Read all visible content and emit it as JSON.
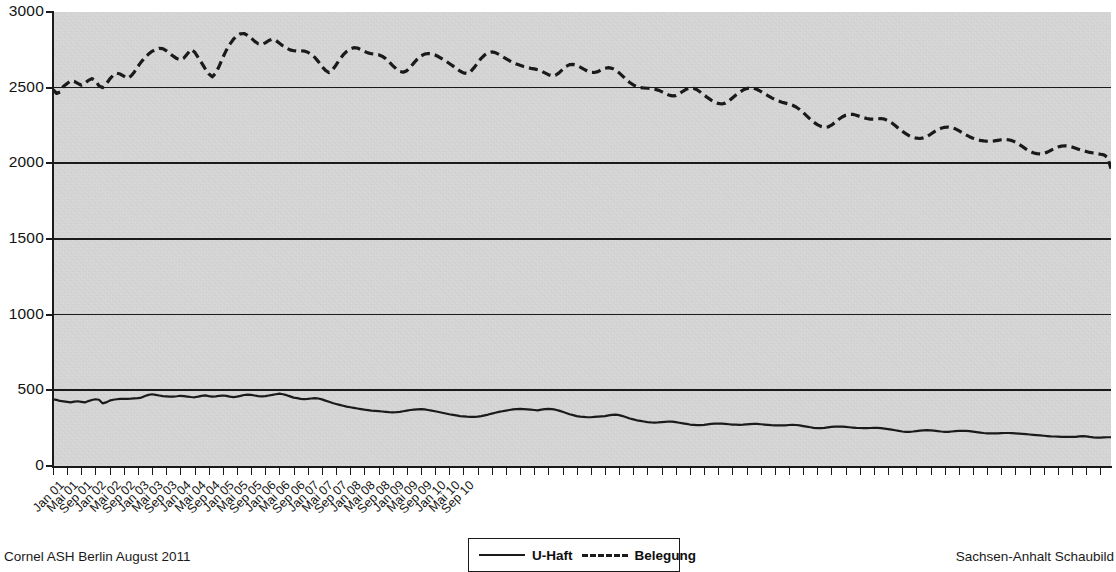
{
  "chart_data": {
    "type": "line",
    "title": "",
    "subtitle": "",
    "xlabel": "",
    "ylabel": "",
    "ylim": [
      0,
      3000
    ],
    "ytick_step": 500,
    "ytick_labels": [
      "3000",
      "2500",
      "2000",
      "1500",
      "1000",
      "500",
      "0"
    ],
    "ytick_values": [
      3000,
      2500,
      2000,
      1500,
      1000,
      500,
      0
    ],
    "grid": "horizontal",
    "legend_position": "bottom-center",
    "plot_background": "#d7d7d7",
    "line_color": "#1a1a1a",
    "x_start": "Jan 01",
    "x_end": "Dez 10",
    "x_tick_interval_months": 4,
    "xtick_labels": [
      "Jan 01",
      "Mai 01",
      "Sep 01",
      "Jan 02",
      "Mai 02",
      "Sep 02",
      "Jan 03",
      "Mai 03",
      "Sep 03",
      "Jan 04",
      "Mai 04",
      "Sep 04",
      "Jan 05",
      "Mai 05",
      "Sep 05",
      "Jan 06",
      "Mai 06",
      "Sep 06",
      "Jan 07",
      "Mai 07",
      "Sep 07",
      "Jan 08",
      "Mai 08",
      "Sep 08",
      "Jan 09",
      "Mai 09",
      "Sep 09",
      "Jan 10",
      "Mai 10",
      "Sep 10"
    ],
    "series": [
      {
        "name": "U-Haft",
        "style": "solid",
        "values": [
          441,
          437,
          430,
          427,
          424,
          420,
          425,
          428,
          424,
          420,
          429,
          436,
          441,
          438,
          414,
          420,
          432,
          438,
          441,
          443,
          444,
          444,
          445,
          447,
          449,
          452,
          462,
          470,
          474,
          470,
          466,
          462,
          460,
          458,
          459,
          461,
          464,
          462,
          459,
          456,
          454,
          458,
          463,
          467,
          462,
          458,
          460,
          464,
          466,
          463,
          458,
          455,
          458,
          463,
          469,
          472,
          470,
          466,
          462,
          460,
          462,
          466,
          470,
          474,
          478,
          474,
          468,
          460,
          452,
          448,
          444,
          442,
          443,
          446,
          449,
          446,
          440,
          432,
          424,
          416,
          410,
          404,
          398,
          392,
          388,
          384,
          380,
          376,
          372,
          369,
          366,
          364,
          362,
          360,
          358,
          356,
          355,
          356,
          358,
          362,
          366,
          370,
          372,
          374,
          376,
          374,
          370,
          366,
          362,
          357,
          352,
          347,
          342,
          338,
          334,
          330,
          328,
          326,
          325,
          324,
          326,
          330,
          335,
          340,
          346,
          352,
          358,
          362,
          366,
          370,
          374,
          376,
          377,
          376,
          374,
          372,
          370,
          368,
          372,
          376,
          378,
          376,
          372,
          366,
          358,
          350,
          342,
          336,
          330,
          326,
          324,
          322,
          322,
          324,
          326,
          328,
          330,
          334,
          338,
          340,
          336,
          330,
          322,
          314,
          308,
          302,
          298,
          294,
          290,
          288,
          287,
          288,
          290,
          292,
          294,
          293,
          290,
          286,
          282,
          278,
          274,
          272,
          270,
          270,
          272,
          275,
          278,
          280,
          281,
          280,
          278,
          276,
          274,
          273,
          272,
          273,
          275,
          277,
          279,
          278,
          276,
          274,
          272,
          270,
          269,
          268,
          268,
          269,
          271,
          272,
          271,
          268,
          264,
          260,
          256,
          252,
          250,
          250,
          252,
          255,
          258,
          260,
          261,
          260,
          258,
          256,
          254,
          252,
          251,
          250,
          250,
          251,
          252,
          252,
          250,
          247,
          244,
          240,
          236,
          232,
          228,
          226,
          226,
          228,
          231,
          234,
          236,
          237,
          236,
          234,
          231,
          228,
          226,
          226,
          228,
          230,
          232,
          233,
          232,
          230,
          227,
          224,
          221,
          218,
          216,
          215,
          215,
          216,
          217,
          218,
          218,
          217,
          216,
          214,
          212,
          210,
          208,
          206,
          204,
          202,
          200,
          198,
          196,
          195,
          194,
          193,
          193,
          192,
          192,
          193,
          196,
          198,
          196,
          192,
          189,
          188,
          188,
          189,
          190,
          190
        ]
      },
      {
        "name": "Belegung",
        "style": "dashed",
        "values": [
          2487,
          2462,
          2472,
          2510,
          2528,
          2545,
          2542,
          2528,
          2516,
          2528,
          2548,
          2560,
          2546,
          2512,
          2500,
          2524,
          2556,
          2582,
          2596,
          2590,
          2576,
          2562,
          2576,
          2604,
          2640,
          2672,
          2700,
          2722,
          2740,
          2752,
          2760,
          2758,
          2744,
          2726,
          2708,
          2692,
          2684,
          2696,
          2724,
          2752,
          2736,
          2700,
          2664,
          2626,
          2592,
          2572,
          2596,
          2644,
          2700,
          2748,
          2788,
          2820,
          2844,
          2856,
          2858,
          2846,
          2828,
          2806,
          2790,
          2786,
          2796,
          2812,
          2820,
          2812,
          2794,
          2776,
          2762,
          2750,
          2744,
          2742,
          2744,
          2742,
          2734,
          2720,
          2700,
          2672,
          2640,
          2614,
          2600,
          2618,
          2650,
          2686,
          2716,
          2740,
          2756,
          2764,
          2762,
          2752,
          2740,
          2730,
          2724,
          2722,
          2718,
          2708,
          2692,
          2670,
          2646,
          2624,
          2608,
          2602,
          2612,
          2636,
          2664,
          2690,
          2710,
          2722,
          2726,
          2724,
          2716,
          2704,
          2690,
          2676,
          2660,
          2644,
          2626,
          2610,
          2598,
          2594,
          2606,
          2632,
          2664,
          2694,
          2716,
          2730,
          2736,
          2732,
          2720,
          2706,
          2692,
          2678,
          2666,
          2656,
          2648,
          2640,
          2634,
          2628,
          2624,
          2618,
          2610,
          2598,
          2586,
          2578,
          2582,
          2598,
          2620,
          2640,
          2652,
          2654,
          2648,
          2636,
          2622,
          2610,
          2602,
          2600,
          2606,
          2618,
          2628,
          2632,
          2628,
          2616,
          2598,
          2576,
          2554,
          2534,
          2518,
          2506,
          2500,
          2498,
          2496,
          2494,
          2490,
          2484,
          2474,
          2462,
          2452,
          2446,
          2448,
          2460,
          2476,
          2490,
          2498,
          2496,
          2486,
          2470,
          2452,
          2434,
          2418,
          2404,
          2396,
          2392,
          2398,
          2412,
          2432,
          2452,
          2470,
          2484,
          2494,
          2498,
          2496,
          2488,
          2476,
          2462,
          2448,
          2434,
          2422,
          2412,
          2404,
          2398,
          2392,
          2384,
          2372,
          2356,
          2336,
          2314,
          2292,
          2272,
          2256,
          2244,
          2238,
          2240,
          2252,
          2270,
          2290,
          2306,
          2318,
          2324,
          2324,
          2318,
          2310,
          2302,
          2296,
          2292,
          2292,
          2294,
          2296,
          2292,
          2282,
          2268,
          2250,
          2230,
          2212,
          2196,
          2182,
          2172,
          2166,
          2164,
          2168,
          2178,
          2192,
          2208,
          2222,
          2232,
          2238,
          2240,
          2236,
          2228,
          2216,
          2202,
          2188,
          2176,
          2166,
          2158,
          2152,
          2148,
          2146,
          2146,
          2148,
          2152,
          2156,
          2158,
          2156,
          2150,
          2140,
          2126,
          2110,
          2094,
          2080,
          2070,
          2064,
          2062,
          2066,
          2074,
          2086,
          2098,
          2108,
          2114,
          2116,
          2114,
          2108,
          2100,
          2092,
          2084,
          2078,
          2072,
          2068,
          2064,
          2060,
          2056,
          2040,
          1965
        ]
      }
    ],
    "annotations": []
  },
  "legend": {
    "entries": [
      {
        "label": "U-Haft",
        "style": "solid"
      },
      {
        "label": "Belegung",
        "style": "dashed"
      }
    ]
  },
  "footer": {
    "left": "Cornel  ASH Berlin  August 2011",
    "right": "Sachsen-Anhalt  Schaubild"
  }
}
